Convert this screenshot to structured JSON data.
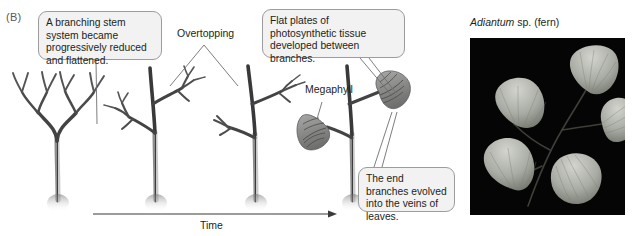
{
  "figure": {
    "panel_label": "(B)",
    "background_color": "#ffffff",
    "width": 633,
    "height": 236
  },
  "callouts": [
    {
      "id": "stem-reduction",
      "text": "A branching stem system became progressively reduced and flattened.",
      "x": 38,
      "y": 11,
      "w": 124,
      "h": 49,
      "leader": [
        [
          96,
          60
        ],
        [
          96,
          122
        ]
      ]
    },
    {
      "id": "flat-plates",
      "text": "Flat plates of photosynthetic tissue developed between branches.",
      "x": 262,
      "y": 9,
      "w": 143,
      "h": 49,
      "leader": [
        [
          358,
          58
        ],
        [
          388,
          92
        ]
      ]
    },
    {
      "id": "end-branches",
      "text": "The end branches evolved into the veins of leaves.",
      "x": 358,
      "y": 167,
      "w": 97,
      "h": 45,
      "leader": [
        [
          376,
          167
        ],
        [
          392,
          118
        ]
      ]
    }
  ],
  "labels": {
    "overtopping": "Overtopping",
    "megaphyll": "Megaphyll"
  },
  "axis": {
    "label": "Time",
    "arrow_from_x": 93,
    "arrow_to_x": 337,
    "arrow_y": 214
  },
  "photo": {
    "caption_genus": "Adiantum",
    "caption_rest": " sp. (fern)",
    "x": 470,
    "y": 38,
    "w": 155,
    "h": 177,
    "background_color": "#050505",
    "leaflet_color": "#b9bbb5",
    "description": "maidenhair fern frond with five fan-shaped leaflets on dark background"
  },
  "stages": [
    {
      "id": "stage-1",
      "name": "dichotomously-branching-stem",
      "base_x": 58,
      "description": "Equally dichotomous branching, no dominant axis"
    },
    {
      "id": "stage-2",
      "name": "overtopped-stem",
      "base_x": 155,
      "description": "Main axis overtops lateral branch systems"
    },
    {
      "id": "stage-3",
      "name": "planated-branch-system",
      "base_x": 255,
      "description": "Lateral branch systems flattened into one plane"
    },
    {
      "id": "stage-4",
      "name": "webbed-megaphyll",
      "base_x": 352,
      "description": "Webbing between flattened branches forms leaf blades"
    }
  ],
  "colors": {
    "stem_dark": "#3a3a3c",
    "stem_mid": "#6e6e70",
    "leaf_fill": "#8f9090",
    "callout_fill": "#f2f2f2",
    "callout_border": "#9c9c9c",
    "text": "#231f20"
  }
}
